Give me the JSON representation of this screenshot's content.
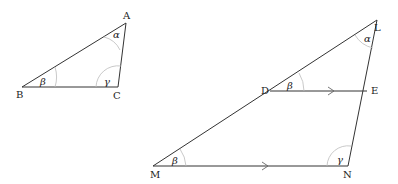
{
  "diagram": {
    "small_triangle": {
      "vertices": {
        "A": "A",
        "B": "B",
        "C": "C"
      },
      "angles": {
        "A": "α",
        "B": "β",
        "C": "γ"
      }
    },
    "large_triangle": {
      "vertices": {
        "L": "L",
        "M": "M",
        "N": "N",
        "D": "D",
        "E": "E"
      },
      "angles": {
        "L": "α",
        "M": "β",
        "D": "β",
        "N": "γ"
      },
      "parallel_marks": [
        "DE",
        "MN"
      ]
    }
  }
}
